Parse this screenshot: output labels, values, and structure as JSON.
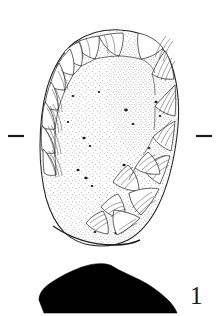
{
  "figure": {
    "number_label": "1",
    "caption": "",
    "background_color": "#ffffff",
    "ink_color": "#222222",
    "section_fill_color": "#000000",
    "canvas": {
      "width": 221,
      "height": 316
    }
  },
  "artifact_plan": {
    "name": "lithic-artifact-plan-view",
    "description": "Retouched stone tool, plan view with stippled surface and flake scars",
    "bounds": {
      "x": 38,
      "y": 29,
      "width": 140,
      "height": 218
    },
    "outline_path": "M 120,30 C 146,31 165,44 172,66 C 179,88 180,112 177,136 C 174,160 168,186 158,206 C 150,222 139,234 128,240 C 116,246 102,247 90,245 C 78,243 70,238 64,232 C 56,224 50,212 46,198 C 42,182 40,164 40,146 C 40,126 42,106 47,88 C 53,68 62,52 75,42 C 88,33 104,29 120,30 Z",
    "bottom_edge_path": "M 53,225 C 70,238 92,245 112,245 C 124,245 132,244 138,241",
    "surface_texture": "stipple",
    "edge_treatment": "continuous-retouch"
  },
  "flake_scars_left": [
    {
      "path": "M 76,42 C 83,39 91,37 99,36 C 99,44 97,52 94,58 C 86,56 80,50 76,42 Z"
    },
    {
      "path": "M 99,36 C 108,34 116,33 124,33 C 124,41 122,49 119,55 C 111,54 104,45 99,36 Z"
    },
    {
      "path": "M 64,51 C 70,46 75,43 80,41 C 83,49 83,58 81,65 C 73,63 67,58 64,51 Z"
    },
    {
      "path": "M 56,66 C 60,59 65,53 70,48 C 74,56 75,66 73,74 C 65,73 59,70 56,66 Z"
    },
    {
      "path": "M 50,84 C 52,76 55,69 59,62 C 64,70 66,80 65,89 C 57,89 52,87 50,84 Z"
    },
    {
      "path": "M 45,104 C 46,96 48,88 51,81 C 56,89 59,99 58,109 C 50,109 46,107 45,104 Z"
    },
    {
      "path": "M 42,124 C 42,116 43,108 45,101 C 51,108 55,118 55,128 C 47,129 43,127 42,124 Z"
    }
  ],
  "flake_scars_right": [
    {
      "path": "M 139,33 C 149,35 158,40 164,48 C 158,54 150,58 142,59 C 139,51 138,42 139,33 Z"
    },
    {
      "path": "M 166,52 C 171,60 174,70 175,80 C 167,81 159,79 153,75 C 157,66 161,58 166,52 Z"
    },
    {
      "path": "M 176,86 C 177,96 177,107 176,117 C 168,116 161,112 156,107 C 163,99 170,92 176,86 Z"
    },
    {
      "path": "M 176,122 C 175,132 174,142 172,152 C 164,149 158,144 154,138 C 161,131 169,126 176,122 Z"
    },
    {
      "path": "M 171,157 C 168,167 165,176 161,185 C 153,181 147,175 144,168 C 152,163 162,159 171,157 Z"
    }
  ],
  "flake_scars_lower_right": [
    {
      "path": "M 160,190 C 155,200 149,209 142,216 C 135,210 131,202 130,194 C 140,190 150,188 160,190 Z"
    },
    {
      "path": "M 140,219 C 133,226 125,232 117,236 C 113,228 112,219 114,211 C 124,212 133,215 140,219 Z"
    },
    {
      "path": "M 128,166 C 134,173 137,182 137,191 C 128,191 119,188 113,183 C 118,175 123,170 128,166 Z"
    },
    {
      "path": "M 118,196 C 122,203 124,211 123,219 C 114,218 107,214 102,208 C 107,202 113,198 118,196 Z"
    }
  ],
  "tick_marks": [
    {
      "name": "section-tick-left",
      "x1": 8,
      "y1": 136,
      "x2": 24,
      "y2": 136
    },
    {
      "name": "section-tick-right",
      "x1": 196,
      "y1": 136,
      "x2": 212,
      "y2": 136
    }
  ],
  "artifact_section": {
    "name": "lithic-artifact-cross-section",
    "description": "Solid black cross-section profile of the tool",
    "bounds": {
      "x": 38,
      "y": 263,
      "width": 140,
      "height": 50
    },
    "path": "M 44,313 L 40,298 C 41,292 45,287 52,282 C 60,277 70,272 81,268 C 90,265 98,263 105,264 C 111,265 114,268 118,270 C 124,273 131,275 139,279 C 149,284 159,291 167,299 C 172,304 175,309 176,313 Z"
  },
  "stipple": {
    "density_note": "dense fine dots over interior, sparse near edges",
    "dot_color": "#3a3a3a"
  }
}
